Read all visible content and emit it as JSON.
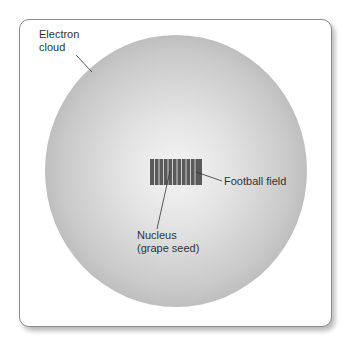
{
  "diagram": {
    "type": "atom-scale-analogy",
    "labels": {
      "electron_cloud_line1": "Electron",
      "electron_cloud_line2": "cloud",
      "football_field": "Football field",
      "nucleus_line1": "Nucleus",
      "nucleus_line2": "(grape seed)"
    },
    "colors": {
      "field": "#5a5a5a",
      "field_stripe": "#c8c8c8",
      "sphere_edge": "#9a9a9a",
      "sphere_center": "#f4f4f4",
      "leader_line": "#333333"
    },
    "field_stripes": 11
  }
}
